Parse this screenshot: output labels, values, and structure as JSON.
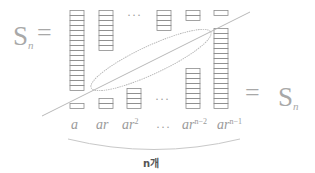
{
  "diagram": {
    "left_label": {
      "base": "S",
      "subscript": "n",
      "equals": "="
    },
    "right_label": {
      "equals": "=",
      "base": "S",
      "subscript": "n"
    },
    "terms": [
      {
        "base": "a",
        "exp": ""
      },
      {
        "base": "ar",
        "exp": ""
      },
      {
        "base": "ar",
        "exp": "2"
      },
      {
        "base": "···",
        "exp": ""
      },
      {
        "base": "ar",
        "exp": "n−2"
      },
      {
        "base": "ar",
        "exp": "n−1"
      }
    ],
    "top_dots": "···",
    "bottom_dots": "···",
    "count_label": "n개",
    "top_columns_cells": [
      16,
      8,
      null,
      4,
      2,
      1
    ],
    "bottom_columns_cells": [
      1,
      2,
      4,
      null,
      8,
      16
    ],
    "colors": {
      "stroke": "#8c8c8c",
      "text": "#9a9a9a",
      "line": "#b0b0b0"
    }
  }
}
